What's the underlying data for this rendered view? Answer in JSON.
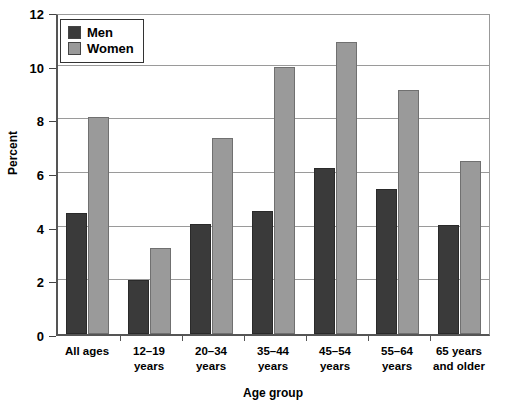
{
  "chart_data": {
    "type": "bar",
    "title": "",
    "xlabel": "Age group",
    "ylabel": "Percent",
    "ylim": [
      0,
      12
    ],
    "yticks": [
      0,
      2,
      4,
      6,
      8,
      10,
      12
    ],
    "grid": true,
    "legend_position": "top-left",
    "categories": [
      "All ages",
      "12–19 years",
      "20–34 years",
      "35–44 years",
      "45–54 years",
      "55–64 years",
      "65 years and older"
    ],
    "category_lines": [
      [
        "All ages",
        ""
      ],
      [
        "12–19",
        "years"
      ],
      [
        "20–34",
        "years"
      ],
      [
        "35–44",
        "years"
      ],
      [
        "45–54",
        "years"
      ],
      [
        "55–64",
        "years"
      ],
      [
        "65 years",
        "and older"
      ]
    ],
    "series": [
      {
        "name": "Men",
        "color": "#3a3a3a",
        "values": [
          4.5,
          2.0,
          4.1,
          4.6,
          6.2,
          5.4,
          4.05
        ]
      },
      {
        "name": "Women",
        "color": "#9a9a9a",
        "values": [
          8.1,
          3.2,
          7.3,
          9.95,
          10.9,
          9.1,
          6.45
        ]
      }
    ]
  },
  "legend": {
    "items": [
      {
        "label": "Men",
        "color": "#3a3a3a"
      },
      {
        "label": "Women",
        "color": "#9a9a9a"
      }
    ]
  },
  "axes": {
    "y_title": "Percent",
    "x_title": "Age group",
    "y_tick_labels": [
      "0",
      "2",
      "4",
      "6",
      "8",
      "10",
      "12"
    ]
  }
}
